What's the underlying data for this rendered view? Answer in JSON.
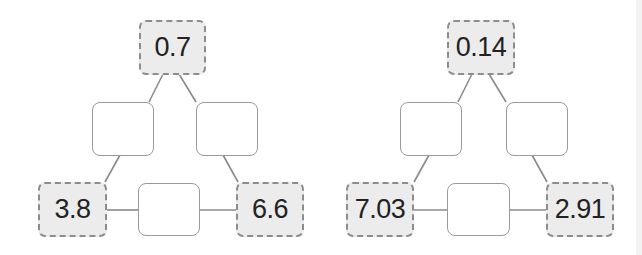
{
  "puzzles": [
    {
      "top": "0.7",
      "bottom_left": "3.8",
      "bottom_right": "6.6",
      "blanks": {
        "mid_left": "",
        "mid_right": "",
        "bottom_middle": ""
      }
    },
    {
      "top": "0.14",
      "bottom_left": "7.03",
      "bottom_right": "2.91",
      "blanks": {
        "mid_left": "",
        "mid_right": "",
        "bottom_middle": ""
      }
    }
  ],
  "colors": {
    "given_fill": "#ececec",
    "given_border": "#8c8c8c",
    "blank_border": "#9a9a9a",
    "line": "#8a8a8a",
    "text": "#222222"
  }
}
